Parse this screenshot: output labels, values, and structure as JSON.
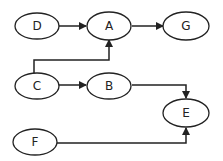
{
  "diagram": {
    "nodes": [
      {
        "id": "D",
        "label": "D"
      },
      {
        "id": "A",
        "label": "A"
      },
      {
        "id": "G",
        "label": "G"
      },
      {
        "id": "C",
        "label": "C"
      },
      {
        "id": "B",
        "label": "B"
      },
      {
        "id": "E",
        "label": "E"
      },
      {
        "id": "F",
        "label": "F"
      }
    ],
    "edges": [
      {
        "from": "D",
        "to": "A"
      },
      {
        "from": "A",
        "to": "G"
      },
      {
        "from": "C",
        "to": "A"
      },
      {
        "from": "C",
        "to": "B"
      },
      {
        "from": "B",
        "to": "E"
      },
      {
        "from": "F",
        "to": "E"
      }
    ],
    "colors": {
      "stroke": "#222222",
      "fill": "#ffffff"
    }
  }
}
